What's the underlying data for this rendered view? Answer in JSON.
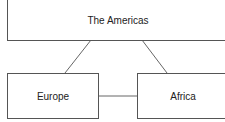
{
  "diagram": {
    "nodes": [
      {
        "id": "americas",
        "label": "The Americas"
      },
      {
        "id": "europe",
        "label": "Europe"
      },
      {
        "id": "africa",
        "label": "Africa"
      }
    ],
    "edges": [
      {
        "from": "americas",
        "to": "europe"
      },
      {
        "from": "americas",
        "to": "africa"
      },
      {
        "from": "europe",
        "to": "africa"
      }
    ],
    "colors": {
      "stroke": "#555555",
      "text": "#222222",
      "background": "#ffffff"
    }
  }
}
